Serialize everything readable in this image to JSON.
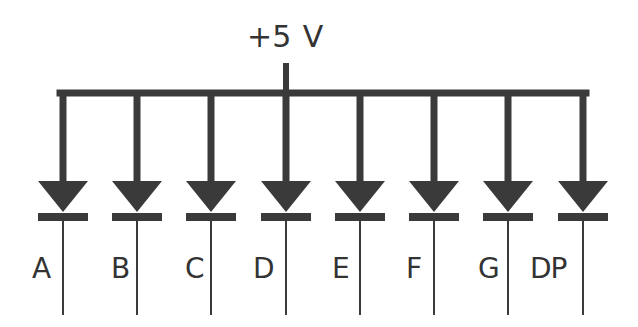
{
  "diagram": {
    "supply_label": "+5 V",
    "colors": {
      "wire": "#3a3a3a",
      "text": "#333333",
      "background": "#ffffff"
    },
    "geometry": {
      "bus_y": 93,
      "bus_left": 63,
      "bus_right": 583,
      "stub_x": 286,
      "stub_top": 63,
      "diode_top": 181,
      "diode_tip": 212,
      "bar_y": 213,
      "bar_h": 8,
      "diode_half_w": 25,
      "lead_bottom": 315,
      "label_y": 255
    },
    "diodes": [
      {
        "label": "A",
        "x": 63,
        "label_x": 32
      },
      {
        "label": "B",
        "x": 137,
        "label_x": 111
      },
      {
        "label": "C",
        "x": 211,
        "label_x": 185
      },
      {
        "label": "D",
        "x": 286,
        "label_x": 253
      },
      {
        "label": "E",
        "x": 360,
        "label_x": 332
      },
      {
        "label": "F",
        "x": 434,
        "label_x": 406
      },
      {
        "label": "G",
        "x": 508,
        "label_x": 478
      },
      {
        "label": "DP",
        "x": 583,
        "label_x": 530
      }
    ]
  }
}
